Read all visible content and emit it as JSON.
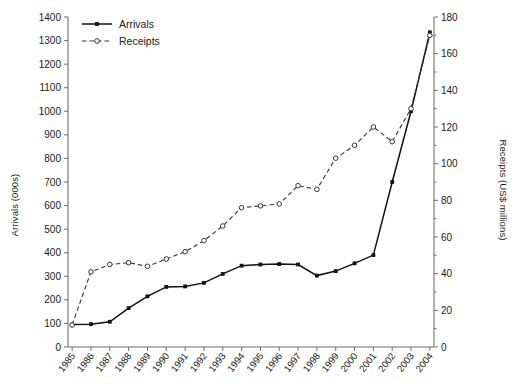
{
  "chart_data": {
    "type": "line",
    "title": "",
    "xlabel": "",
    "grid": false,
    "legend_position": "top-left",
    "categories": [
      "1985",
      "1986",
      "1987",
      "1988",
      "1989",
      "1990",
      "1991",
      "1992",
      "1993",
      "1994",
      "1995",
      "1996",
      "1997",
      "1998",
      "1999",
      "2000",
      "2001",
      "2002",
      "2003",
      "2004"
    ],
    "axes": {
      "left": {
        "label": "Arrivals (000s)",
        "ylim": [
          0,
          1400
        ],
        "ticks": [
          0,
          100,
          200,
          300,
          400,
          500,
          600,
          700,
          800,
          900,
          1000,
          1100,
          1200,
          1300,
          1400
        ],
        "tick_labels": [
          "0",
          "100",
          "200",
          "300",
          "400",
          "500",
          "600",
          "700",
          "800",
          "900",
          "1000",
          "1100",
          "1200",
          "1300",
          "1400"
        ]
      },
      "right": {
        "label": "Receipts (US$ millions)",
        "ylim": [
          0,
          180
        ],
        "ticks": [
          0,
          20,
          40,
          60,
          80,
          100,
          120,
          140,
          160,
          180
        ],
        "tick_labels": [
          "0",
          "20",
          "40",
          "60",
          "80",
          "100",
          "120",
          "140",
          "160",
          "180"
        ]
      }
    },
    "series": [
      {
        "name": "Arrivals",
        "axis": "left",
        "units": "000s",
        "style": "solid",
        "marker": "filled-square",
        "color": "#111111",
        "values": [
          95,
          97,
          107,
          165,
          215,
          255,
          257,
          272,
          310,
          345,
          350,
          352,
          350,
          303,
          322,
          355,
          390,
          700,
          1000,
          1335
        ]
      },
      {
        "name": "Receipts",
        "axis": "right",
        "units": "US$ millions",
        "style": "dashed",
        "marker": "open-circle",
        "color": "#333333",
        "values": [
          12,
          41,
          45,
          46,
          44,
          48,
          52,
          58,
          66,
          76,
          77,
          78,
          88,
          86,
          103,
          110,
          120,
          112,
          130,
          170
        ]
      }
    ]
  },
  "legend": {
    "items": [
      {
        "label": "Arrivals",
        "style": "solid",
        "marker": "filled-square"
      },
      {
        "label": "Receipts",
        "style": "dashed",
        "marker": "open-circle"
      }
    ]
  }
}
